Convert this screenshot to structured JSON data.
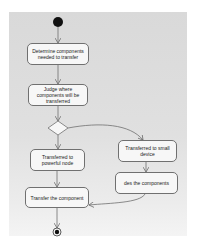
{
  "diagram": {
    "type": "uml-activity",
    "start_node": {
      "label": "start"
    },
    "end_node": {
      "label": "end"
    },
    "actions": [
      {
        "id": "a1",
        "label": "Determine components needed to transfer"
      },
      {
        "id": "a2",
        "label": "Judge where components will be transferred"
      },
      {
        "id": "a3",
        "label": "Transferred to powerful node"
      },
      {
        "id": "a4",
        "label": "Transferred to small device"
      },
      {
        "id": "a5",
        "label": "des the components"
      },
      {
        "id": "a6",
        "label": "Transfer the component"
      }
    ],
    "decision": {
      "id": "d1"
    },
    "edges": [
      {
        "from": "start",
        "to": "a1"
      },
      {
        "from": "a1",
        "to": "a2"
      },
      {
        "from": "a2",
        "to": "d1"
      },
      {
        "from": "d1",
        "to": "a3"
      },
      {
        "from": "d1",
        "to": "a4"
      },
      {
        "from": "a4",
        "to": "a5"
      },
      {
        "from": "a3",
        "to": "a6"
      },
      {
        "from": "a5",
        "to": "a6"
      },
      {
        "from": "a6",
        "to": "end"
      }
    ],
    "colors": {
      "background": "#dcdcdc",
      "node_fill": "#f7f7f7",
      "node_border": "#707070",
      "edge": "#707070",
      "start_fill": "#111111"
    }
  }
}
